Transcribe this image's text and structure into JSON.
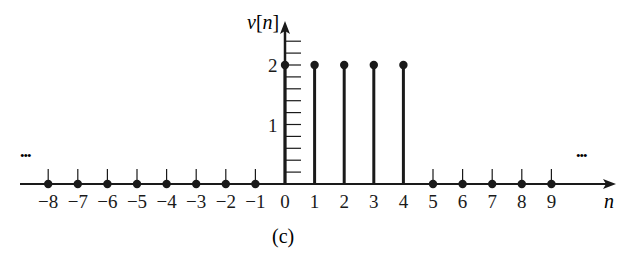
{
  "figure": {
    "caption": "(c)",
    "ylabel": "v[n]",
    "xlabel": "n",
    "ellipsis_left": "•••",
    "ellipsis_right": "•••"
  },
  "chart_data": {
    "type": "stem",
    "title": "",
    "caption": "(c)",
    "xlabel": "n",
    "ylabel": "v[n]",
    "x": [
      -8,
      -7,
      -6,
      -5,
      -4,
      -3,
      -2,
      -1,
      0,
      1,
      2,
      3,
      4,
      5,
      6,
      7,
      8,
      9
    ],
    "values": [
      0,
      0,
      0,
      0,
      0,
      0,
      0,
      0,
      2,
      2,
      2,
      2,
      2,
      0,
      0,
      0,
      0,
      0
    ],
    "x_tick_labels": [
      "−8",
      "−7",
      "−6",
      "−5",
      "−4",
      "−3",
      "−2",
      "−1",
      "0",
      "1",
      "2",
      "3",
      "4",
      "5",
      "6",
      "7",
      "8",
      "9"
    ],
    "y_tick_labels": [
      "1",
      "2"
    ],
    "y_minor_tick_step": 0.2,
    "ylim": [
      0,
      2.6
    ],
    "xlim": [
      -9,
      11
    ],
    "grid": false,
    "legend": null,
    "annotations": [
      "... (continues left)",
      "... (continues right)"
    ],
    "colors": {
      "stem": "#1a1a1a",
      "axis": "#1a1a1a"
    }
  }
}
